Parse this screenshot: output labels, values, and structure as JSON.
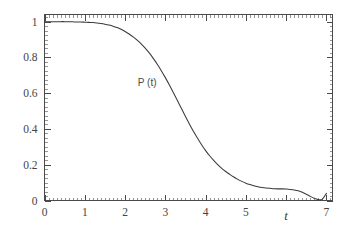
{
  "chart_data": {
    "type": "line",
    "title": "",
    "subtitle": "",
    "xlabel": "t",
    "ylabel": "",
    "xlim": [
      0,
      7.15
    ],
    "ylim": [
      0,
      1.04
    ],
    "grid": false,
    "legend": false,
    "annotations": [
      {
        "text": "P (t)",
        "x": 2.55,
        "y": 0.665
      }
    ],
    "x_ticks": [
      0,
      1,
      2,
      3,
      4,
      5,
      6,
      7
    ],
    "x_tick_labels": [
      "0",
      "1",
      "2",
      "3",
      "4",
      "5",
      "6",
      "7"
    ],
    "x_tick_labels_shown": [
      "0",
      "1",
      "2",
      "3",
      "4",
      "5",
      "",
      "7"
    ],
    "x_minor_step": 0.1,
    "y_ticks": [
      0,
      0.2,
      0.4,
      0.6,
      0.8,
      1
    ],
    "y_tick_labels": [
      "0",
      "0.2",
      "0.4",
      "0.6",
      "0.8",
      "1"
    ],
    "y_minor_step": 0.025,
    "frame": "box",
    "tick_direction": "in",
    "series": [
      {
        "name": "P (t)",
        "color": "#3a3a3a",
        "x": [
          0,
          0.1,
          0.2,
          0.3,
          0.4,
          0.5,
          0.6,
          0.7,
          0.8,
          0.9,
          1.0,
          1.1,
          1.2,
          1.3,
          1.4,
          1.5,
          1.6,
          1.7,
          1.8,
          1.9,
          2.0,
          2.1,
          2.2,
          2.3,
          2.4,
          2.5,
          2.6,
          2.7,
          2.8,
          2.9,
          3.0,
          3.1,
          3.2,
          3.3,
          3.4,
          3.5,
          3.6,
          3.7,
          3.8,
          3.9,
          4.0,
          4.1,
          4.2,
          4.3,
          4.4,
          4.5,
          4.6,
          4.7,
          4.8,
          4.9,
          5.0,
          5.1,
          5.2,
          5.3,
          5.4,
          5.5,
          5.6,
          5.7,
          5.8,
          5.9,
          6.0,
          6.1,
          6.2,
          6.3,
          6.4,
          6.5,
          6.6,
          6.7,
          6.8,
          6.9,
          7.0
        ],
        "y": [
          1.0,
          1.0,
          1.0,
          1.0,
          1.0,
          1.0,
          0.999,
          0.999,
          0.998,
          0.998,
          0.997,
          0.996,
          0.995,
          0.993,
          0.99,
          0.986,
          0.981,
          0.975,
          0.967,
          0.957,
          0.945,
          0.931,
          0.915,
          0.897,
          0.876,
          0.852,
          0.825,
          0.795,
          0.762,
          0.726,
          0.687,
          0.646,
          0.603,
          0.559,
          0.514,
          0.47,
          0.427,
          0.386,
          0.348,
          0.312,
          0.279,
          0.25,
          0.224,
          0.201,
          0.18,
          0.162,
          0.146,
          0.131,
          0.118,
          0.107,
          0.097,
          0.089,
          0.082,
          0.077,
          0.073,
          0.07,
          0.068,
          0.066,
          0.065,
          0.065,
          0.064,
          0.062,
          0.059,
          0.054,
          0.046,
          0.035,
          0.023,
          0.012,
          0.005,
          0.008,
          0.04
        ]
      }
    ]
  }
}
